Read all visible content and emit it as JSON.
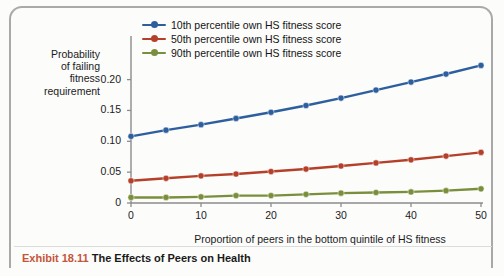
{
  "figure": {
    "caption_number": "Exhibit 18.11",
    "caption_title": "The Effects of Peers on Health",
    "caption_number_color": "#c4553b",
    "frame_color": "#a9a9a9"
  },
  "chart_data": {
    "type": "line",
    "title": "",
    "subtitle": "",
    "xlabel": "Proportion of peers in the bottom quintile of HS fitness",
    "ylabel": "Probability\nof failing\nfitness\nrequirement",
    "x": [
      0,
      5,
      10,
      15,
      20,
      25,
      30,
      35,
      40,
      45,
      50
    ],
    "xlim": [
      0,
      50
    ],
    "ylim": [
      0,
      0.235
    ],
    "xticks": [
      0,
      10,
      20,
      30,
      40,
      50
    ],
    "xticklabels": [
      "0",
      "10",
      "20",
      "30",
      "40",
      "50"
    ],
    "yticks": [
      0,
      0.05,
      0.1,
      0.15,
      0.2
    ],
    "yticklabels": [
      "0",
      "0.05",
      "0.10",
      "0.15",
      "0.20"
    ],
    "grid": false,
    "legend_position": "upper left",
    "markers": "circle",
    "series": [
      {
        "name": "10th percentile own HS fitness score",
        "color": "#2d5f9e",
        "values": [
          0.108,
          0.118,
          0.127,
          0.137,
          0.147,
          0.158,
          0.17,
          0.183,
          0.196,
          0.209,
          0.223
        ]
      },
      {
        "name": "50th percentile own HS fitness score",
        "color": "#b5402a",
        "values": [
          0.036,
          0.04,
          0.044,
          0.047,
          0.051,
          0.055,
          0.06,
          0.065,
          0.07,
          0.076,
          0.082
        ]
      },
      {
        "name": "90th percentile own HS fitness score",
        "color": "#7a8f3c",
        "values": [
          0.009,
          0.009,
          0.01,
          0.012,
          0.012,
          0.014,
          0.016,
          0.017,
          0.018,
          0.02,
          0.023
        ]
      }
    ]
  },
  "legend": {
    "items": [
      {
        "label": "10th percentile own HS fitness score",
        "color": "#2d5f9e"
      },
      {
        "label": "50th percentile own HS fitness score",
        "color": "#b5402a"
      },
      {
        "label": "90th percentile own HS fitness score",
        "color": "#7a8f3c"
      }
    ]
  }
}
